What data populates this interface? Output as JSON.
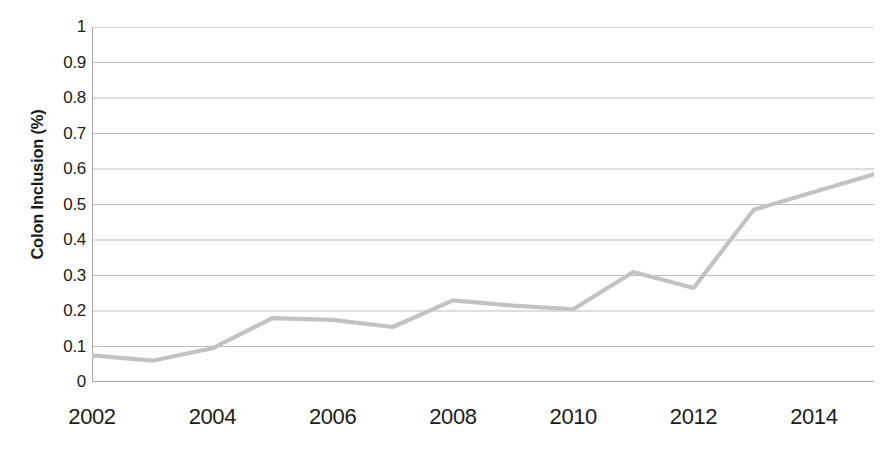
{
  "chart_data": {
    "type": "line",
    "title": "",
    "xlabel": "",
    "ylabel": "Colon Inclusion (%)",
    "x": [
      2002,
      2003,
      2004,
      2005,
      2006,
      2007,
      2008,
      2009,
      2010,
      2011,
      2012,
      2013,
      2014,
      2015
    ],
    "values": [
      0.075,
      0.06,
      0.095,
      0.18,
      0.175,
      0.155,
      0.23,
      0.215,
      0.205,
      0.31,
      0.265,
      0.485,
      0.535,
      0.585
    ],
    "series": [
      {
        "name": "Colon Inclusion",
        "values": [
          0.075,
          0.06,
          0.095,
          0.18,
          0.175,
          0.155,
          0.23,
          0.215,
          0.205,
          0.31,
          0.265,
          0.485,
          0.535,
          0.585
        ]
      }
    ],
    "xlim": [
      2002,
      2015
    ],
    "ylim": [
      0,
      1
    ],
    "ytick_labels": [
      "1",
      "0.9",
      "0.8",
      "0.7",
      "0.6",
      "0.5",
      "0.4",
      "0.3",
      "0.2",
      "0.1",
      "0"
    ],
    "ytick_values": [
      1,
      0.9,
      0.8,
      0.7,
      0.6,
      0.5,
      0.4,
      0.3,
      0.2,
      0.1,
      0
    ],
    "xtick_labels": [
      "2002",
      "2004",
      "2006",
      "2008",
      "2010",
      "2012",
      "2014"
    ],
    "xtick_values": [
      2002,
      2004,
      2006,
      2008,
      2010,
      2012,
      2014
    ],
    "grid": "horizontal",
    "legend": "none",
    "line_color": "#c2c2c2",
    "grid_color": "#b5b5b5",
    "axis_color": "#a9a9a9",
    "text_color": "#1c1c1c",
    "background": "#ffffff"
  }
}
